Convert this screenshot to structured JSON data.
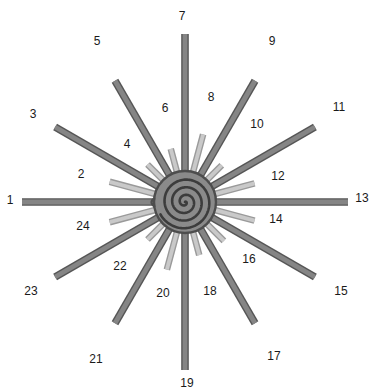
{
  "figure": {
    "width": 372,
    "height": 390,
    "background_color": "#ffffff"
  },
  "center": {
    "x": 185,
    "y": 202,
    "disc_radius": 31,
    "disc_fill": "#8a8a8a",
    "disc_stroke": "#4d4d4d",
    "spiral_stroke": "#3c3c3c",
    "spiral_turns": 3.6,
    "name": "central-spiral"
  },
  "style": {
    "long_ray_fill": "#858585",
    "long_ray_stroke": "#565656",
    "short_ray_fill": "#c9c9c9",
    "short_ray_stroke": "#9a9a9a",
    "label_color": "#1a1a1a",
    "label_font_size": 12
  },
  "chart_data": {
    "type": "radial-starburst",
    "n_rays": 24,
    "angle_step_deg": 15,
    "start_angle_deg": 180,
    "direction": "clockwise-from-left",
    "center": [
      185,
      202
    ],
    "inner_radius": 22,
    "categories": [
      "1",
      "2",
      "3",
      "4",
      "5",
      "6",
      "7",
      "8",
      "9",
      "10",
      "11",
      "12",
      "13",
      "14",
      "15",
      "16",
      "17",
      "18",
      "19",
      "20",
      "21",
      "22",
      "23",
      "24"
    ],
    "values": [
      163,
      78,
      150,
      53,
      140,
      55,
      168,
      70,
      140,
      52,
      150,
      72,
      163,
      72,
      150,
      55,
      140,
      55,
      168,
      70,
      140,
      53,
      150,
      78
    ],
    "series": [
      {
        "name": "long-dark-rays",
        "indices": [
          1,
          3,
          5,
          7,
          9,
          11,
          13,
          15,
          17,
          19,
          21,
          23
        ],
        "color": "#858585",
        "width": 6
      },
      {
        "name": "short-light-rays",
        "indices": [
          2,
          4,
          6,
          8,
          10,
          12,
          14,
          16,
          18,
          20,
          22,
          24
        ],
        "color": "#c9c9c9",
        "width": 5
      }
    ],
    "xlabel": "",
    "ylabel": "",
    "grid": false,
    "legend": "none"
  },
  "rays": [
    {
      "id": 1,
      "label": "1",
      "angle": 180,
      "length": 163,
      "kind": "long",
      "label_x": 10,
      "label_y": 200
    },
    {
      "id": 2,
      "label": "2",
      "angle": 195,
      "length": 78,
      "kind": "short",
      "label_x": 81,
      "label_y": 174
    },
    {
      "id": 3,
      "label": "3",
      "angle": 210,
      "length": 150,
      "kind": "long",
      "label_x": 33,
      "label_y": 114
    },
    {
      "id": 4,
      "label": "4",
      "angle": 225,
      "length": 53,
      "kind": "short",
      "label_x": 127,
      "label_y": 144
    },
    {
      "id": 5,
      "label": "5",
      "angle": 240,
      "length": 140,
      "kind": "long",
      "label_x": 97,
      "label_y": 41
    },
    {
      "id": 6,
      "label": "6",
      "angle": 255,
      "length": 55,
      "kind": "short",
      "label_x": 165,
      "label_y": 108
    },
    {
      "id": 7,
      "label": "7",
      "angle": 270,
      "length": 168,
      "kind": "long",
      "label_x": 182,
      "label_y": 16
    },
    {
      "id": 8,
      "label": "8",
      "angle": 285,
      "length": 70,
      "kind": "short",
      "label_x": 211,
      "label_y": 97
    },
    {
      "id": 9,
      "label": "9",
      "angle": 300,
      "length": 140,
      "kind": "long",
      "label_x": 272,
      "label_y": 41
    },
    {
      "id": 10,
      "label": "10",
      "angle": 315,
      "length": 52,
      "kind": "short",
      "label_x": 257,
      "label_y": 124
    },
    {
      "id": 11,
      "label": "11",
      "angle": 330,
      "length": 150,
      "kind": "long",
      "label_x": 339,
      "label_y": 107
    },
    {
      "id": 12,
      "label": "12",
      "angle": 345,
      "length": 72,
      "kind": "short",
      "label_x": 278,
      "label_y": 176
    },
    {
      "id": 13,
      "label": "13",
      "angle": 0,
      "length": 163,
      "kind": "long",
      "label_x": 362,
      "label_y": 198
    },
    {
      "id": 14,
      "label": "14",
      "angle": 15,
      "length": 72,
      "kind": "short",
      "label_x": 276,
      "label_y": 219
    },
    {
      "id": 15,
      "label": "15",
      "angle": 30,
      "length": 150,
      "kind": "long",
      "label_x": 341,
      "label_y": 291
    },
    {
      "id": 16,
      "label": "16",
      "angle": 45,
      "length": 55,
      "kind": "short",
      "label_x": 249,
      "label_y": 259
    },
    {
      "id": 17,
      "label": "17",
      "angle": 60,
      "length": 140,
      "kind": "long",
      "label_x": 274,
      "label_y": 356
    },
    {
      "id": 18,
      "label": "18",
      "angle": 75,
      "length": 55,
      "kind": "short",
      "label_x": 210,
      "label_y": 291
    },
    {
      "id": 19,
      "label": "19",
      "angle": 90,
      "length": 168,
      "kind": "long",
      "label_x": 187,
      "label_y": 383
    },
    {
      "id": 20,
      "label": "20",
      "angle": 105,
      "length": 70,
      "kind": "short",
      "label_x": 163,
      "label_y": 293
    },
    {
      "id": 21,
      "label": "21",
      "angle": 120,
      "length": 140,
      "kind": "long",
      "label_x": 96,
      "label_y": 359
    },
    {
      "id": 22,
      "label": "22",
      "angle": 135,
      "length": 53,
      "kind": "short",
      "label_x": 120,
      "label_y": 266
    },
    {
      "id": 23,
      "label": "23",
      "angle": 150,
      "length": 150,
      "kind": "long",
      "label_x": 31,
      "label_y": 291
    },
    {
      "id": 24,
      "label": "24",
      "angle": 165,
      "length": 78,
      "kind": "short",
      "label_x": 83,
      "label_y": 226
    }
  ]
}
